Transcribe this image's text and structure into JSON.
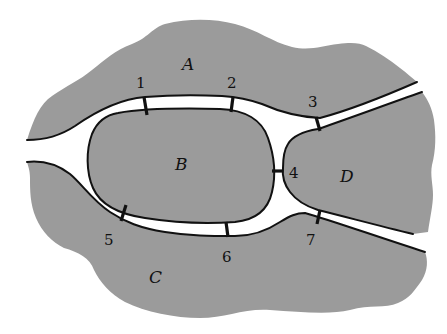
{
  "diagram": {
    "title": "",
    "colors": {
      "land": "#9b9b9b",
      "water": "#ffffff",
      "outline": "#111111"
    },
    "regions": [
      {
        "id": "A",
        "label": "A"
      },
      {
        "id": "B",
        "label": "B"
      },
      {
        "id": "C",
        "label": "C"
      },
      {
        "id": "D",
        "label": "D"
      }
    ],
    "bridges": [
      {
        "id": "1",
        "label": "1",
        "connects": [
          "A",
          "B"
        ]
      },
      {
        "id": "2",
        "label": "2",
        "connects": [
          "A",
          "B"
        ]
      },
      {
        "id": "3",
        "label": "3",
        "connects": [
          "A",
          "D"
        ]
      },
      {
        "id": "4",
        "label": "4",
        "connects": [
          "B",
          "D"
        ]
      },
      {
        "id": "5",
        "label": "5",
        "connects": [
          "C",
          "B"
        ]
      },
      {
        "id": "6",
        "label": "6",
        "connects": [
          "C",
          "B"
        ]
      },
      {
        "id": "7",
        "label": "7",
        "connects": [
          "C",
          "D"
        ]
      }
    ]
  }
}
